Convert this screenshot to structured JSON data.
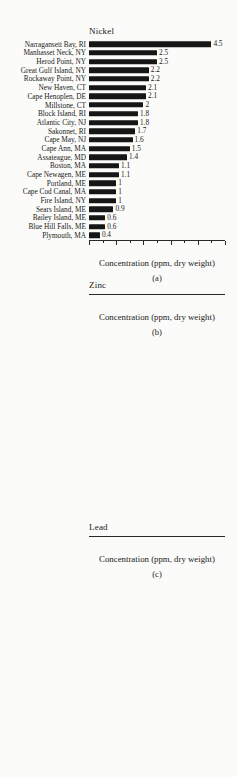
{
  "figure": {
    "panels": [
      "(a)",
      "(b)",
      "(c)"
    ],
    "bar_color": "#161616",
    "text_color": "#1a1a1a",
    "background_color": "#fbfbf9"
  },
  "chart_data": [
    {
      "type": "bar",
      "orientation": "horizontal",
      "title": "Nickel",
      "panel_label": "(a)",
      "xlabel": "Concentration (ppm, dry weight)",
      "xlim": [
        0,
        5
      ],
      "major_ticks": [
        0,
        1,
        2,
        3,
        4,
        5
      ],
      "minor_ticks": [
        0.5,
        1.5,
        2.5,
        3.5,
        4.5
      ],
      "grid": false,
      "categories": [
        "Narragansett Bay, RI",
        "Manhasset Neck, NY",
        "Herod Point, NY",
        "Great Gulf Island, NY",
        "Rockaway Point, NY",
        "New Haven, CT",
        "Cape Henoplen, DE",
        "Millstone, CT",
        "Block Island, RI",
        "Atlantic City, NJ",
        "Sakonnet, RI",
        "Cape May, NJ",
        "Cape Ann, MA",
        "Assateague, MD",
        "Boston, MA",
        "Cape Newagen, ME",
        "Portland, ME",
        "Cape Cod Canal, MA",
        "Fire Island, NY",
        "Sears Island, ME",
        "Bailey Island, ME",
        "Blue Hill Falls, ME",
        "Plymouth, MA"
      ],
      "values": [
        4.5,
        2.5,
        2.5,
        2.2,
        2.2,
        2.1,
        2.1,
        2,
        1.8,
        1.8,
        1.7,
        1.6,
        1.5,
        1.4,
        1.1,
        1.1,
        1,
        1,
        1,
        0.9,
        0.6,
        0.6,
        0.4
      ]
    },
    {
      "type": "bar",
      "orientation": "horizontal",
      "title": "Zinc",
      "panel_label": "(b)",
      "xlabel": "Concentration (ppm, dry weight)",
      "xlim": [
        0,
        200
      ],
      "major_ticks": [
        0,
        100,
        200
      ],
      "minor_ticks": [
        50,
        150
      ],
      "grid": false,
      "categories": [
        "Great Gulf Island, NY",
        "Cape May, NJ",
        "Boston, MA",
        "Atlantic City, NJ",
        "Block Island, RI",
        "Cape Newagen, ME",
        "Rockaway Point, NY",
        "Millstone, CT",
        "Narragansett Bay, RI",
        "Cape Ann, MA",
        "Cape Henoplen, DE",
        "Herod Point, NY",
        "Sakonnet, RI",
        "Fire Island, NY",
        "Blue Hill Falls, ME",
        "Manhasset Neck, NY",
        "New Haven, CT",
        "Cape Cod Canal, MA",
        "Plymouth, MA",
        "Assateague, MD",
        "Bailey Island, ME",
        "Sears Island, ME",
        "Portland, ME"
      ],
      "values": [
        189,
        170,
        143,
        140,
        136,
        135,
        135,
        128,
        122,
        119,
        112,
        111,
        105,
        99,
        94,
        91,
        90,
        81,
        79,
        75,
        75,
        67,
        67
      ]
    },
    {
      "type": "bar",
      "orientation": "horizontal",
      "title": "Lead",
      "panel_label": "(c)",
      "xlabel": "Concentration (ppm, dry weight)",
      "xlim": [
        0,
        12
      ],
      "major_ticks": [
        0,
        2,
        4,
        6,
        8,
        10,
        12
      ],
      "minor_ticks": [
        1,
        3,
        5,
        7,
        9,
        11
      ],
      "grid": false,
      "categories": [
        "Cape Ann, MA",
        "Boston, MA",
        "Cape Newagen, ME",
        "Manhasset Neck, NY",
        "Narragansett Bay, RI",
        "Portland, ME",
        "Plymouth, MA",
        "Cape Cod Canal, MA",
        "New Haven, CT",
        "Bailey Island, ME",
        "Rockaway Point, NY",
        "Millstone, CT",
        "Fire Island, NY",
        "Block Island, RI",
        "Blue Hill Falls, ME",
        "Herod Point, NY",
        "Sakonnet, RI",
        "Cape May, NJ",
        "Sears Island, ME",
        "Atlantic City, NJ",
        "Cape Henoplen, DE",
        "Assateague, MD"
      ],
      "values": [
        11.1,
        9.5,
        7,
        6,
        5.1,
        5,
        4.6,
        3.7,
        3.1,
        3,
        3,
        2.3,
        2.2,
        1.9,
        1.9,
        1.8,
        1.7,
        1.5,
        1.4,
        1.4,
        1.2,
        0.6
      ]
    }
  ]
}
